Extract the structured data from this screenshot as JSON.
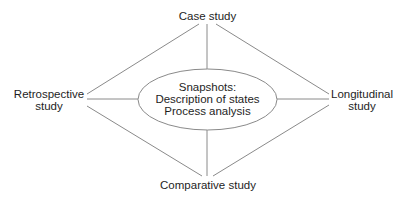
{
  "diagram": {
    "center": {
      "lines": [
        "Snapshots:",
        "Description of states",
        "Process analysis"
      ]
    },
    "nodes": {
      "top": {
        "line1": "Case study"
      },
      "left": {
        "line1": "Retrospective",
        "line2": "study"
      },
      "right": {
        "line1": "Longitudinal",
        "line2": "study"
      },
      "bottom": {
        "line1": "Comparative study"
      }
    },
    "colors": {
      "line": "#8a8a8a",
      "text": "#1e1e1e",
      "background": "#ffffff"
    }
  }
}
